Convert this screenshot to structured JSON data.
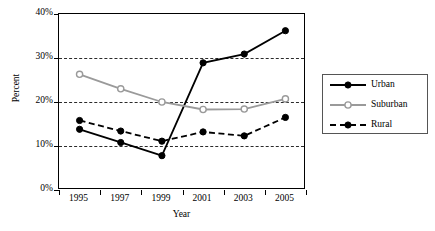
{
  "chart_data": {
    "type": "line",
    "title": "",
    "xlabel": "Year",
    "ylabel": "Percent",
    "categories": [
      "1995",
      "1997",
      "1999",
      "2001",
      "2003",
      "2005"
    ],
    "ylim": [
      0,
      40
    ],
    "yticks": [
      "0%",
      "10%",
      "20%",
      "30%",
      "40%"
    ],
    "ytick_values": [
      0,
      10,
      20,
      30,
      40
    ],
    "grid": "horizontal-dashed",
    "legend_position": "right",
    "series": [
      {
        "name": "Urban",
        "values": [
          13.8,
          10.8,
          7.8,
          28.9,
          30.9,
          36.2
        ],
        "color": "#000000",
        "line_style": "solid",
        "marker": "filled-circle"
      },
      {
        "name": "Suburban",
        "values": [
          26.3,
          23.0,
          20.0,
          18.3,
          18.4,
          20.7
        ],
        "color": "#9a9a9a",
        "line_style": "solid",
        "marker": "open-circle"
      },
      {
        "name": "Rural",
        "values": [
          15.8,
          13.4,
          11.1,
          13.2,
          12.3,
          16.5
        ],
        "color": "#000000",
        "line_style": "dashed",
        "marker": "filled-circle"
      }
    ]
  }
}
